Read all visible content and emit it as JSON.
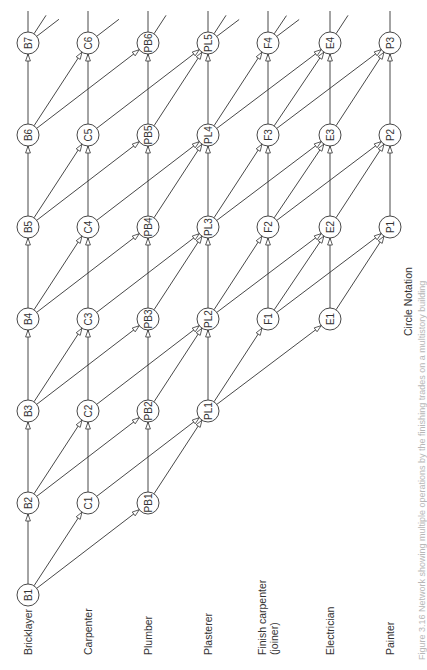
{
  "diagram": {
    "notation_label": "Circle Notation",
    "caption": "Figure 3.16 Network showing multiple operations by the finishing trades on a multistory building",
    "trades": [
      {
        "key": "B",
        "label": "Bricklayer",
        "label2": "",
        "x": 28,
        "row_offset": -1,
        "count": 7,
        "next": [
          "B",
          "C",
          "PB"
        ]
      },
      {
        "key": "C",
        "label": "Carpenter",
        "label2": "",
        "x": 88,
        "row_offset": 0,
        "count": 6,
        "next": [
          "C",
          "PL"
        ]
      },
      {
        "key": "PB",
        "label": "Plumber",
        "label2": "",
        "x": 148,
        "row_offset": 0,
        "count": 6,
        "next": [
          "PB",
          "PL"
        ]
      },
      {
        "key": "PL",
        "label": "Plasterer",
        "label2": "",
        "x": 208,
        "row_offset": 1,
        "count": 5,
        "next": [
          "PL",
          "F",
          "E"
        ]
      },
      {
        "key": "F",
        "label": "Finish carpenter",
        "label2": "(joiner)",
        "x": 268,
        "row_offset": 2,
        "count": 4,
        "next": [
          "F",
          "E",
          "P"
        ]
      },
      {
        "key": "E",
        "label": "Electrician",
        "label2": "",
        "x": 330,
        "row_offset": 2,
        "count": 4,
        "next": [
          "E",
          "P"
        ]
      },
      {
        "key": "P",
        "label": "Painter",
        "label2": "",
        "x": 390,
        "row_offset": 3,
        "count": 3,
        "next": [
          "P"
        ]
      }
    ],
    "row_y": [
      595,
      503,
      411,
      319,
      227,
      135,
      43
    ],
    "node_radius": 11,
    "nodes": [
      "B1",
      "B2",
      "B3",
      "B4",
      "B5",
      "B6",
      "B7",
      "C1",
      "C2",
      "C3",
      "C4",
      "C5",
      "C6",
      "PB1",
      "PB2",
      "PB3",
      "PB4",
      "PB5",
      "PB6",
      "PL1",
      "PL2",
      "PL3",
      "PL4",
      "PL5",
      "F1",
      "F2",
      "F3",
      "F4",
      "E1",
      "E2",
      "E3",
      "E4",
      "P1",
      "P2",
      "P3"
    ],
    "edges": [
      [
        "B1",
        "B2"
      ],
      [
        "B1",
        "C1"
      ],
      [
        "B1",
        "PB1"
      ],
      [
        "B2",
        "B3"
      ],
      [
        "B2",
        "C2"
      ],
      [
        "B2",
        "PB2"
      ],
      [
        "B3",
        "B4"
      ],
      [
        "B3",
        "C3"
      ],
      [
        "B3",
        "PB3"
      ],
      [
        "B4",
        "B5"
      ],
      [
        "B4",
        "C4"
      ],
      [
        "B4",
        "PB4"
      ],
      [
        "B5",
        "B6"
      ],
      [
        "B5",
        "C5"
      ],
      [
        "B5",
        "PB5"
      ],
      [
        "B6",
        "B7"
      ],
      [
        "B6",
        "C6"
      ],
      [
        "B6",
        "PB6"
      ],
      [
        "C1",
        "C2"
      ],
      [
        "C1",
        "PL1"
      ],
      [
        "C2",
        "C3"
      ],
      [
        "C2",
        "PL2"
      ],
      [
        "C3",
        "C4"
      ],
      [
        "C3",
        "PL3"
      ],
      [
        "C4",
        "C5"
      ],
      [
        "C4",
        "PL4"
      ],
      [
        "C5",
        "C6"
      ],
      [
        "C5",
        "PL5"
      ],
      [
        "PB1",
        "PB2"
      ],
      [
        "PB1",
        "PL1"
      ],
      [
        "PB2",
        "PB3"
      ],
      [
        "PB2",
        "PL2"
      ],
      [
        "PB3",
        "PB4"
      ],
      [
        "PB3",
        "PL3"
      ],
      [
        "PB4",
        "PB5"
      ],
      [
        "PB4",
        "PL4"
      ],
      [
        "PB5",
        "PB6"
      ],
      [
        "PB5",
        "PL5"
      ],
      [
        "PL1",
        "PL2"
      ],
      [
        "PL1",
        "F1"
      ],
      [
        "PL1",
        "E1"
      ],
      [
        "PL2",
        "PL3"
      ],
      [
        "PL2",
        "F2"
      ],
      [
        "PL2",
        "E2"
      ],
      [
        "PL3",
        "PL4"
      ],
      [
        "PL3",
        "F3"
      ],
      [
        "PL3",
        "E3"
      ],
      [
        "PL4",
        "PL5"
      ],
      [
        "PL4",
        "F4"
      ],
      [
        "PL4",
        "E4"
      ],
      [
        "F1",
        "F2"
      ],
      [
        "F1",
        "E2"
      ],
      [
        "F1",
        "P1"
      ],
      [
        "F2",
        "F3"
      ],
      [
        "F2",
        "E3"
      ],
      [
        "F2",
        "P2"
      ],
      [
        "F3",
        "F4"
      ],
      [
        "F3",
        "E4"
      ],
      [
        "F3",
        "P3"
      ],
      [
        "E1",
        "E2"
      ],
      [
        "E1",
        "P1"
      ],
      [
        "E2",
        "E3"
      ],
      [
        "E2",
        "P2"
      ],
      [
        "E3",
        "E4"
      ],
      [
        "E3",
        "P3"
      ],
      [
        "P1",
        "P2"
      ],
      [
        "P2",
        "P3"
      ]
    ],
    "top_stubs": [
      {
        "node": "B7",
        "directions": [
          "up",
          "C",
          "PB"
        ]
      },
      {
        "node": "C6",
        "directions": [
          "up",
          "PL"
        ]
      },
      {
        "node": "PB6",
        "directions": [
          "up",
          "PL"
        ]
      },
      {
        "node": "PL5",
        "directions": [
          "up",
          "F",
          "E"
        ]
      },
      {
        "node": "F4",
        "directions": [
          "up",
          "E",
          "P"
        ]
      },
      {
        "node": "E4",
        "directions": [
          "up",
          "P"
        ]
      },
      {
        "node": "P3",
        "directions": [
          "up"
        ]
      }
    ]
  }
}
